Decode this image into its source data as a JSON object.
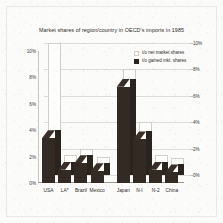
{
  "chart_data": {
    "type": "bar",
    "title": "Market shares of region/country in OECD's imports in 1985",
    "xlabel": "",
    "ylabel": "",
    "categories": [
      "USA",
      "LA*",
      "Brazil",
      "Mexico",
      "Japan",
      "N-I",
      "N-2",
      "China"
    ],
    "series": [
      {
        "name": "t/o net market shares",
        "style": "open",
        "values": [
          10.0,
          1.5,
          2.0,
          1.4,
          8.0,
          4.0,
          1.5,
          1.3
        ]
      },
      {
        "name": "t/o gained mkt. shares",
        "style": "solid",
        "values": [
          3.4,
          1.0,
          1.5,
          0.9,
          7.3,
          3.3,
          1.0,
          0.8
        ]
      }
    ],
    "ylim": [
      0,
      10
    ],
    "yticks": [
      0,
      2,
      4,
      6,
      8,
      10
    ],
    "ytick_labels_left": [
      "0%",
      "2%",
      "4%",
      "6%",
      "8%",
      "10%"
    ],
    "ytick_labels_right": [
      "0%",
      "2%",
      "4%",
      "6%",
      "8%",
      "10%"
    ],
    "grid": true,
    "legend_position": "top-right",
    "group_gap_after": "Mexico",
    "footnote": "*"
  },
  "legend": {
    "items": [
      {
        "label": "t/o net market shares"
      },
      {
        "label": "t/o gained mkt. shares"
      }
    ]
  },
  "colors": {
    "bar_front": "#332a23",
    "bar_side": "#2b231d",
    "bar_top": "#3a2f28",
    "bar_open": "#fdfdfc",
    "grid": "#dedcd8",
    "axis": "#9b9792",
    "text": "#2e2b28",
    "background": "#fbfbfa"
  }
}
